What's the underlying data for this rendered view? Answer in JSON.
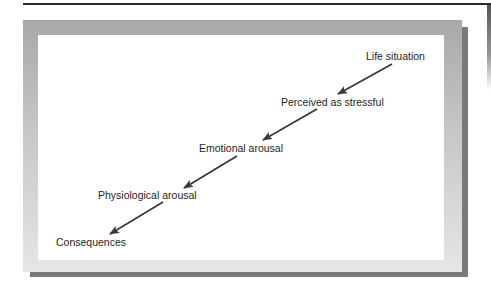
{
  "diagram": {
    "type": "flowchart",
    "direction": "top-right to bottom-left",
    "steps": [
      {
        "label": "Life situation"
      },
      {
        "label": "Perceived as stressful"
      },
      {
        "label": "Emotional arousal"
      },
      {
        "label": "Physiological arousal"
      },
      {
        "label": "Consequences"
      }
    ],
    "colors": {
      "arrow": "#3a3a3a",
      "text": "#1e1e1e",
      "frame": "#b8b8b8",
      "shadow": "#7a7a7a",
      "background": "#ffffff"
    }
  }
}
